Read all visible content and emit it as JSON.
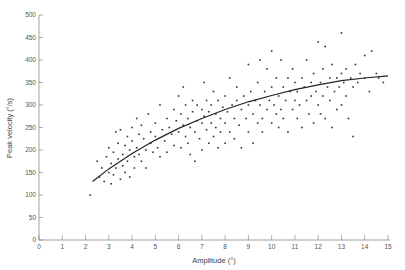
{
  "chart_data": {
    "type": "scatter",
    "title": "",
    "xlabel": "Amplitude (°)",
    "ylabel": "Peak velocity (°/s)",
    "xlim": [
      0,
      15
    ],
    "ylim": [
      0,
      500
    ],
    "xticks": [
      0,
      1,
      2,
      3,
      4,
      5,
      6,
      7,
      8,
      9,
      10,
      11,
      12,
      13,
      14,
      15
    ],
    "yticks": [
      0,
      50,
      100,
      150,
      200,
      250,
      300,
      350,
      400,
      450,
      500
    ],
    "grid": false,
    "legend": null,
    "colors": {
      "points": "#333333",
      "curve": "#222222",
      "axis": "#888888"
    },
    "fit_curve": {
      "description": "saturating fit through data",
      "x": [
        2.3,
        3,
        4,
        5,
        6,
        7,
        8,
        9,
        10,
        11,
        12,
        13,
        14,
        15
      ],
      "y": [
        130,
        158,
        192,
        222,
        248,
        270,
        290,
        307,
        321,
        334,
        345,
        354,
        360,
        365
      ]
    },
    "series": [
      {
        "name": "saccades",
        "points": [
          [
            2.2,
            100
          ],
          [
            2.5,
            175
          ],
          [
            2.6,
            140
          ],
          [
            2.7,
            160
          ],
          [
            2.8,
            130
          ],
          [
            2.9,
            185
          ],
          [
            3.0,
            150
          ],
          [
            3.0,
            205
          ],
          [
            3.1,
            170
          ],
          [
            3.1,
            125
          ],
          [
            3.2,
            195
          ],
          [
            3.2,
            145
          ],
          [
            3.3,
            240
          ],
          [
            3.3,
            160
          ],
          [
            3.4,
            180
          ],
          [
            3.4,
            215
          ],
          [
            3.5,
            135
          ],
          [
            3.5,
            245
          ],
          [
            3.6,
            190
          ],
          [
            3.6,
            165
          ],
          [
            3.7,
            210
          ],
          [
            3.7,
            150
          ],
          [
            3.8,
            230
          ],
          [
            3.8,
            175
          ],
          [
            3.9,
            200
          ],
          [
            3.9,
            140
          ],
          [
            4.0,
            220
          ],
          [
            4.0,
            250
          ],
          [
            4.1,
            185
          ],
          [
            4.1,
            160
          ],
          [
            4.2,
            270
          ],
          [
            4.2,
            205
          ],
          [
            4.3,
            235
          ],
          [
            4.3,
            190
          ],
          [
            4.4,
            255
          ],
          [
            4.4,
            175
          ],
          [
            4.5,
            225
          ],
          [
            4.6,
            200
          ],
          [
            4.6,
            160
          ],
          [
            4.7,
            280
          ],
          [
            4.8,
            240
          ],
          [
            4.8,
            215
          ],
          [
            4.9,
            195
          ],
          [
            5.0,
            260
          ],
          [
            5.0,
            230
          ],
          [
            5.1,
            205
          ],
          [
            5.2,
            300
          ],
          [
            5.2,
            185
          ],
          [
            5.3,
            245
          ],
          [
            5.4,
            220
          ],
          [
            5.5,
            270
          ],
          [
            5.5,
            195
          ],
          [
            5.6,
            250
          ],
          [
            5.7,
            235
          ],
          [
            5.8,
            290
          ],
          [
            5.8,
            210
          ],
          [
            5.9,
            265
          ],
          [
            6.0,
            240
          ],
          [
            6.0,
            320
          ],
          [
            6.1,
            205
          ],
          [
            6.1,
            280
          ],
          [
            6.2,
            255
          ],
          [
            6.2,
            340
          ],
          [
            6.3,
            230
          ],
          [
            6.3,
            300
          ],
          [
            6.4,
            215
          ],
          [
            6.4,
            270
          ],
          [
            6.5,
            250
          ],
          [
            6.5,
            190
          ],
          [
            6.6,
            310
          ],
          [
            6.6,
            285
          ],
          [
            6.7,
            240
          ],
          [
            6.7,
            175
          ],
          [
            6.8,
            300
          ],
          [
            6.8,
            265
          ],
          [
            6.9,
            225
          ],
          [
            7.0,
            290
          ],
          [
            7.0,
            260
          ],
          [
            7.0,
            200
          ],
          [
            7.1,
            350
          ],
          [
            7.1,
            275
          ],
          [
            7.2,
            245
          ],
          [
            7.2,
            310
          ],
          [
            7.3,
            215
          ],
          [
            7.3,
            285
          ],
          [
            7.4,
            300
          ],
          [
            7.4,
            260
          ],
          [
            7.5,
            230
          ],
          [
            7.5,
            330
          ],
          [
            7.6,
            280
          ],
          [
            7.6,
            250
          ],
          [
            7.7,
            205
          ],
          [
            7.7,
            310
          ],
          [
            7.8,
            270
          ],
          [
            7.8,
            240
          ],
          [
            7.9,
            295
          ],
          [
            8.0,
            320
          ],
          [
            8.0,
            260
          ],
          [
            8.0,
            215
          ],
          [
            8.1,
            285
          ],
          [
            8.2,
            360
          ],
          [
            8.2,
            240
          ],
          [
            8.3,
            300
          ],
          [
            8.4,
            270
          ],
          [
            8.4,
            225
          ],
          [
            8.5,
            310
          ],
          [
            8.5,
            340
          ],
          [
            8.6,
            255
          ],
          [
            8.7,
            290
          ],
          [
            8.7,
            205
          ],
          [
            8.8,
            320
          ],
          [
            8.9,
            270
          ],
          [
            9.0,
            390
          ],
          [
            9.0,
            300
          ],
          [
            9.0,
            240
          ],
          [
            9.1,
            330
          ],
          [
            9.2,
            280
          ],
          [
            9.2,
            215
          ],
          [
            9.3,
            310
          ],
          [
            9.4,
            350
          ],
          [
            9.4,
            260
          ],
          [
            9.5,
            300
          ],
          [
            9.5,
            400
          ],
          [
            9.6,
            270
          ],
          [
            9.6,
            240
          ],
          [
            9.7,
            330
          ],
          [
            9.8,
            290
          ],
          [
            9.8,
            380
          ],
          [
            9.9,
            310
          ],
          [
            10.0,
            260
          ],
          [
            10.0,
            340
          ],
          [
            10.0,
            420
          ],
          [
            10.1,
            300
          ],
          [
            10.2,
            280
          ],
          [
            10.2,
            360
          ],
          [
            10.3,
            250
          ],
          [
            10.3,
            320
          ],
          [
            10.4,
            400
          ],
          [
            10.4,
            290
          ],
          [
            10.5,
            340
          ],
          [
            10.5,
            270
          ],
          [
            10.6,
            310
          ],
          [
            10.7,
            360
          ],
          [
            10.7,
            240
          ],
          [
            10.8,
            330
          ],
          [
            10.9,
            290
          ],
          [
            10.9,
            380
          ],
          [
            11.0,
            310
          ],
          [
            11.0,
            350
          ],
          [
            11.1,
            270
          ],
          [
            11.1,
            330
          ],
          [
            11.2,
            300
          ],
          [
            11.3,
            360
          ],
          [
            11.3,
            250
          ],
          [
            11.4,
            340
          ],
          [
            11.5,
            310
          ],
          [
            11.5,
            400
          ],
          [
            11.6,
            280
          ],
          [
            11.7,
            350
          ],
          [
            11.7,
            320
          ],
          [
            11.8,
            370
          ],
          [
            11.8,
            260
          ],
          [
            11.9,
            330
          ],
          [
            12.0,
            300
          ],
          [
            12.0,
            440
          ],
          [
            12.1,
            350
          ],
          [
            12.1,
            280
          ],
          [
            12.2,
            380
          ],
          [
            12.2,
            320
          ],
          [
            12.3,
            430
          ],
          [
            12.3,
            270
          ],
          [
            12.4,
            340
          ],
          [
            12.5,
            310
          ],
          [
            12.5,
            360
          ],
          [
            12.6,
            390
          ],
          [
            12.6,
            250
          ],
          [
            12.7,
            330
          ],
          [
            12.8,
            360
          ],
          [
            12.8,
            290
          ],
          [
            12.9,
            340
          ],
          [
            13.0,
            460
          ],
          [
            13.0,
            370
          ],
          [
            13.0,
            300
          ],
          [
            13.1,
            350
          ],
          [
            13.2,
            320
          ],
          [
            13.2,
            380
          ],
          [
            13.3,
            270
          ],
          [
            13.4,
            360
          ],
          [
            13.5,
            340
          ],
          [
            13.5,
            230
          ],
          [
            13.6,
            390
          ],
          [
            13.7,
            350
          ],
          [
            13.8,
            370
          ],
          [
            14.0,
            410
          ],
          [
            14.0,
            360
          ],
          [
            14.2,
            330
          ],
          [
            14.3,
            420
          ],
          [
            14.5,
            370
          ],
          [
            14.6,
            360
          ],
          [
            14.8,
            350
          ]
        ]
      }
    ]
  }
}
